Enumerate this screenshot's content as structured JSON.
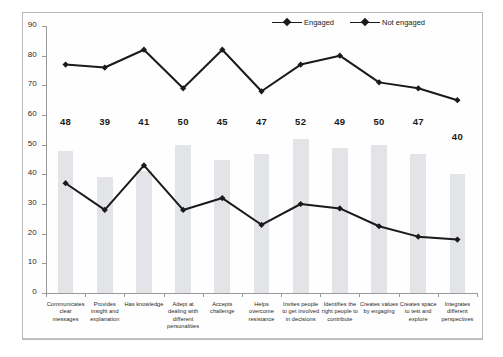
{
  "chart_data": {
    "type": "bar",
    "title": "",
    "xlabel": "",
    "ylabel": "",
    "ylim": [
      0,
      90
    ],
    "yticks": [
      0,
      10,
      20,
      30,
      40,
      50,
      60,
      70,
      80,
      90
    ],
    "grid": false,
    "legend_position": "top-right",
    "categories": [
      "Communicates clear messages",
      "Provides insight and explanation",
      "Has knowledge",
      "Adept at dealing with different personalities",
      "Accepts challenge",
      "Helps overcome resistance",
      "Invites people to get involved in decisions",
      "Identifies the right people to contribute",
      "Creates values by engaging",
      "Creates space to test and explore",
      "Integrates different perspectives"
    ],
    "category_lines": [
      [
        "Communicates",
        "clear messages"
      ],
      [
        "Provides",
        "insight and",
        "explanation"
      ],
      [
        "Has knowledge"
      ],
      [
        "Adept at",
        "dealing with",
        "different",
        "personalities"
      ],
      [
        "Accepts",
        "challenge"
      ],
      [
        "Helps",
        "overcome",
        "resistance"
      ],
      [
        "Invites people",
        "to get involved",
        "in decisions"
      ],
      [
        "Identifies the",
        "right people to",
        "contribute"
      ],
      [
        "Creates values",
        "by engaging"
      ],
      [
        "Creates space",
        "to test and",
        "explore"
      ],
      [
        "Integrates",
        "different",
        "perspectives"
      ]
    ],
    "bars": {
      "name": "Overall",
      "values": [
        48,
        39,
        41,
        50,
        45,
        47,
        52,
        49,
        50,
        47,
        40
      ],
      "color": "#e2e4e8",
      "labels_shown": true
    },
    "series": [
      {
        "name": "Engaged",
        "values": [
          77,
          76,
          82,
          69,
          82,
          68,
          77,
          80,
          71,
          69,
          65
        ],
        "color": "#1a1a1a",
        "marker": "diamond"
      },
      {
        "name": "Not engaged",
        "values": [
          37,
          28,
          43,
          28,
          32,
          23,
          30,
          28.5,
          22.5,
          19,
          18
        ],
        "color": "#1a1a1a",
        "marker": "diamond"
      }
    ]
  },
  "legend": {
    "entries": [
      {
        "label": "Engaged"
      },
      {
        "label": "Not engaged"
      }
    ]
  }
}
